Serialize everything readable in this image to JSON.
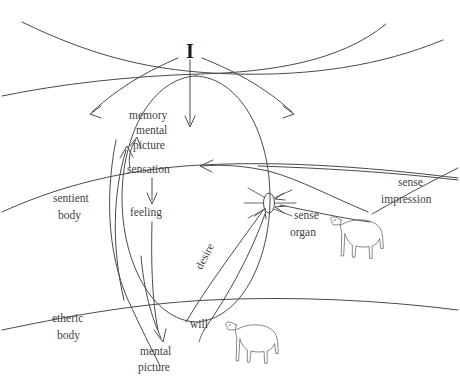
{
  "diagram": {
    "title_glyph": "I",
    "labels": {
      "ego": "I",
      "memory": "memory",
      "mental_1": "mental",
      "picture_1": "picture",
      "sensation": "sensation",
      "feeling": "feeling",
      "sentient_line1": "sentient",
      "sentient_line2": "body",
      "etheric_line1": "etheric",
      "etheric_line2": "body",
      "mental_2": "mental",
      "picture_2": "picture",
      "will": "will",
      "desire": "desire",
      "sense_organ_line1": "sense",
      "sense_organ_line2": "organ",
      "sense_impression_line1": "sense",
      "sense_impression_line2": "impression"
    },
    "figures": [
      {
        "name": "dog-right",
        "caption": "sense impression"
      },
      {
        "name": "dog-bottom",
        "caption": "will"
      }
    ],
    "colors": {
      "background": "#ffffff",
      "stroke": "#4a4a4a",
      "text": "#3f3f3f",
      "ego_text": "#1a1a1a"
    }
  }
}
